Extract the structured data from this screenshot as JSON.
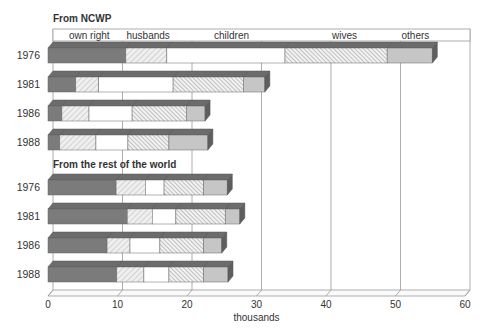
{
  "chart_data": {
    "type": "bar",
    "orientation": "horizontal-stacked-3d",
    "xlabel": "thousands",
    "xlim": [
      0,
      60
    ],
    "xticks": [
      0,
      10,
      20,
      30,
      40,
      50,
      60
    ],
    "grid": true,
    "legend": {
      "position": "top-header-strip",
      "entries": [
        "own right",
        "husbands",
        "children",
        "wives",
        "others"
      ]
    },
    "categories_order": [
      "own right",
      "husbands",
      "children",
      "wives",
      "others"
    ],
    "groups": [
      {
        "title": "From NCWP",
        "rows": [
          {
            "year": "1976",
            "values": [
              11.2,
              5.9,
              17.0,
              14.7,
              6.5
            ]
          },
          {
            "year": "1981",
            "values": [
              4.0,
              3.3,
              10.7,
              10.1,
              3.1
            ]
          },
          {
            "year": "1986",
            "values": [
              2.0,
              3.9,
              6.2,
              7.8,
              2.7
            ]
          },
          {
            "year": "1988",
            "values": [
              1.7,
              5.2,
              4.6,
              5.9,
              5.6
            ]
          }
        ]
      },
      {
        "title": "From the rest of the world",
        "rows": [
          {
            "year": "1976",
            "values": [
              9.8,
              4.2,
              2.7,
              5.7,
              3.4
            ]
          },
          {
            "year": "1981",
            "values": [
              11.4,
              3.6,
              3.4,
              7.1,
              2.1
            ]
          },
          {
            "year": "1986",
            "values": [
              8.5,
              3.3,
              4.3,
              6.3,
              2.6
            ]
          },
          {
            "year": "1988",
            "values": [
              9.9,
              3.9,
              3.6,
              5.0,
              3.5
            ]
          }
        ]
      }
    ]
  },
  "colors": {
    "own_right": "#7b7b7b",
    "own_right_top": "#6c6c6c",
    "end_face": "#5e5e5e",
    "husbands_bg": "#efefef",
    "husbands_hatch": "#b5b5b5",
    "children": "#ffffff",
    "wives_bg": "#f2f2f2",
    "wives_hatch": "#8f8f8f",
    "others": "#c6c6c6",
    "grid": "#9a9a9a",
    "text": "#333333"
  }
}
